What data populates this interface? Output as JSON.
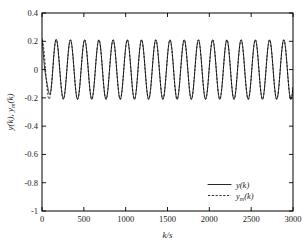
{
  "figure": {
    "background": "#ffffff",
    "foreground": "#000000"
  },
  "axes": {
    "x_title": "k/s",
    "y_title_main": "y(k)",
    "y_title_sep": ", ",
    "y_title_second_base": "y",
    "y_title_second_sub": "m",
    "y_title_second_tail": "(k)",
    "x_ticks": [
      "0",
      "500",
      "1000",
      "1500",
      "2000",
      "2500",
      "3000"
    ],
    "y_ticks": [
      "0.4",
      "0.2",
      "0",
      "-0.2",
      "-0.4",
      "-0.6",
      "-0.8",
      "-1"
    ]
  },
  "legend": {
    "entries": [
      {
        "label_base": "y",
        "label_sub": "",
        "label_tail": "(k)",
        "style": "solid"
      },
      {
        "label_base": "y",
        "label_sub": "m",
        "label_tail": "(k)",
        "style": "dashed"
      }
    ]
  },
  "chart_data": {
    "type": "line",
    "title": "",
    "xlabel": "k/s",
    "ylabel": "y(k), y_m(k)",
    "xlim": [
      0,
      3000
    ],
    "ylim": [
      -1,
      0.4
    ],
    "xticks": [
      0,
      500,
      1000,
      1500,
      2000,
      2500,
      3000
    ],
    "yticks": [
      0.4,
      0.2,
      0,
      -0.2,
      -0.4,
      -0.6,
      -0.8,
      -1
    ],
    "grid": false,
    "legend_position": "lower right",
    "waveform": {
      "shape": "sinusoid",
      "amplitude": 0.21,
      "period_seconds": 170,
      "phase_radians": 1.5708,
      "mean": 0.0,
      "transient_region_seconds": [
        0,
        330
      ],
      "transient_note": "small amplitude/phase deviation of y(k) from y_m(k) near k = 250-330 s before tracking settles",
      "samples_per_second": 1
    },
    "series": [
      {
        "name": "y(k)",
        "style": "solid",
        "color": "#000000",
        "description": "plant output, starts at 0.2, settles to steady sinusoid of amplitude 0.21 tracking the reference model"
      },
      {
        "name": "y_m(k)",
        "style": "dashed",
        "color": "#000000",
        "description": "reference model output, pure sinusoid amplitude 0.21 period 170 s, overlaps y(k) after the initial transient"
      }
    ]
  }
}
